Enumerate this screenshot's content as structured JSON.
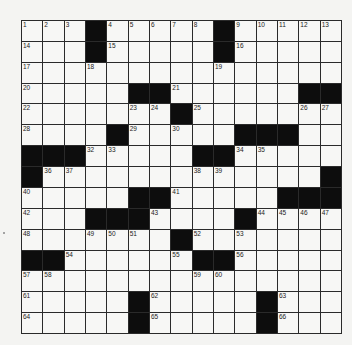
{
  "puzzle": {
    "size": 15,
    "colors": {
      "block": "#0d0d0d",
      "cell": "#f7f7f5",
      "line": "#2a2a2a"
    },
    "rows": [
      "...#.....#.....",
      "...#.....#.....",
      "...............",
      ".....##......##",
      ".......#.......",
      "....#.....###..",
      "###.....##.....",
      "#.............#",
      ".....##.....###",
      "...###....#....",
      ".......#.......",
      "##......##.....",
      "...............",
      ".....#.....#...",
      ".....#.....#..."
    ],
    "numbers": [
      {
        "r": 0,
        "c": 0,
        "n": "1"
      },
      {
        "r": 0,
        "c": 1,
        "n": "2"
      },
      {
        "r": 0,
        "c": 2,
        "n": "3"
      },
      {
        "r": 0,
        "c": 4,
        "n": "4"
      },
      {
        "r": 0,
        "c": 5,
        "n": "5"
      },
      {
        "r": 0,
        "c": 6,
        "n": "6"
      },
      {
        "r": 0,
        "c": 7,
        "n": "7"
      },
      {
        "r": 0,
        "c": 8,
        "n": "8"
      },
      {
        "r": 0,
        "c": 10,
        "n": "9"
      },
      {
        "r": 0,
        "c": 11,
        "n": "10"
      },
      {
        "r": 0,
        "c": 12,
        "n": "11"
      },
      {
        "r": 0,
        "c": 13,
        "n": "12"
      },
      {
        "r": 0,
        "c": 14,
        "n": "13"
      },
      {
        "r": 1,
        "c": 0,
        "n": "14"
      },
      {
        "r": 1,
        "c": 4,
        "n": "15"
      },
      {
        "r": 1,
        "c": 10,
        "n": "16"
      },
      {
        "r": 2,
        "c": 0,
        "n": "17"
      },
      {
        "r": 2,
        "c": 3,
        "n": "18"
      },
      {
        "r": 2,
        "c": 9,
        "n": "19"
      },
      {
        "r": 3,
        "c": 0,
        "n": "20"
      },
      {
        "r": 3,
        "c": 7,
        "n": "21"
      },
      {
        "r": 4,
        "c": 0,
        "n": "22"
      },
      {
        "r": 4,
        "c": 5,
        "n": "23"
      },
      {
        "r": 4,
        "c": 6,
        "n": "24"
      },
      {
        "r": 4,
        "c": 8,
        "n": "25"
      },
      {
        "r": 4,
        "c": 13,
        "n": "26"
      },
      {
        "r": 4,
        "c": 14,
        "n": "27"
      },
      {
        "r": 5,
        "c": 0,
        "n": "28"
      },
      {
        "r": 5,
        "c": 5,
        "n": "29"
      },
      {
        "r": 5,
        "c": 7,
        "n": "30"
      },
      {
        "r": 5,
        "c": 12,
        "n": "31"
      },
      {
        "r": 6,
        "c": 3,
        "n": "32"
      },
      {
        "r": 6,
        "c": 4,
        "n": "33"
      },
      {
        "r": 6,
        "c": 10,
        "n": "34"
      },
      {
        "r": 6,
        "c": 11,
        "n": "35"
      },
      {
        "r": 7,
        "c": 1,
        "n": "36"
      },
      {
        "r": 7,
        "c": 2,
        "n": "37"
      },
      {
        "r": 7,
        "c": 8,
        "n": "38"
      },
      {
        "r": 7,
        "c": 9,
        "n": "39"
      },
      {
        "r": 8,
        "c": 0,
        "n": "40"
      },
      {
        "r": 8,
        "c": 7,
        "n": "41"
      },
      {
        "r": 9,
        "c": 0,
        "n": "42"
      },
      {
        "r": 9,
        "c": 6,
        "n": "43"
      },
      {
        "r": 9,
        "c": 11,
        "n": "44"
      },
      {
        "r": 9,
        "c": 12,
        "n": "45"
      },
      {
        "r": 9,
        "c": 13,
        "n": "46"
      },
      {
        "r": 9,
        "c": 14,
        "n": "47"
      },
      {
        "r": 10,
        "c": 0,
        "n": "48"
      },
      {
        "r": 10,
        "c": 3,
        "n": "49"
      },
      {
        "r": 10,
        "c": 4,
        "n": "50"
      },
      {
        "r": 10,
        "c": 5,
        "n": "51"
      },
      {
        "r": 10,
        "c": 8,
        "n": "52"
      },
      {
        "r": 10,
        "c": 10,
        "n": "53"
      },
      {
        "r": 11,
        "c": 2,
        "n": "54"
      },
      {
        "r": 11,
        "c": 7,
        "n": "55"
      },
      {
        "r": 11,
        "c": 10,
        "n": "56"
      },
      {
        "r": 12,
        "c": 0,
        "n": "57"
      },
      {
        "r": 12,
        "c": 1,
        "n": "58"
      },
      {
        "r": 12,
        "c": 8,
        "n": "59"
      },
      {
        "r": 12,
        "c": 9,
        "n": "60"
      },
      {
        "r": 13,
        "c": 0,
        "n": "61"
      },
      {
        "r": 13,
        "c": 6,
        "n": "62"
      },
      {
        "r": 13,
        "c": 12,
        "n": "63"
      },
      {
        "r": 14,
        "c": 0,
        "n": "64"
      },
      {
        "r": 14,
        "c": 6,
        "n": "65"
      },
      {
        "r": 14,
        "c": 12,
        "n": "66"
      }
    ]
  }
}
